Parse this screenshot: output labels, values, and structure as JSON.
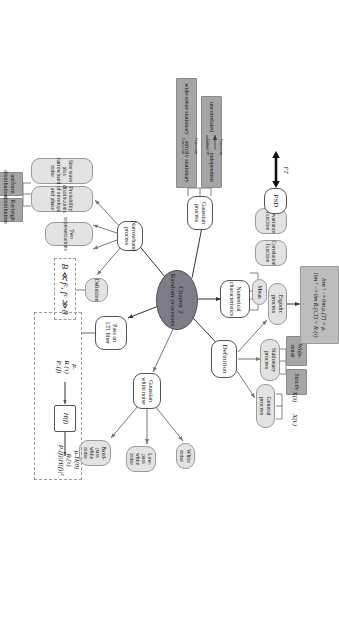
{
  "diagram": {
    "title": "Chapter 2 Random processes",
    "center": {
      "line1": "Chapter 2",
      "line2": "Random processes"
    },
    "colors": {
      "center_fill": "#7d7d8a",
      "dark_node": "#a6a6a6",
      "grey_node": "#e3e3e3",
      "white_node": "#ffffff",
      "formula_fill": "#bdbdbd",
      "stroke": "#555555"
    },
    "branches": {
      "definition": {
        "label": "Definition",
        "children": [
          {
            "label": "Stationary process"
          },
          {
            "label": "General process"
          },
          {
            "label": "Ergodic process"
          }
        ]
      },
      "stationary_kinds": [
        {
          "label": "Wide-sense"
        },
        {
          "label": "Strictly"
        }
      ],
      "general_process_vars": [
        {
          "label": "X(t)"
        },
        {
          "label": "X(tᵢ)"
        }
      ],
      "numerical": {
        "label": "Numerical characteristics",
        "children": [
          {
            "label": "Mean"
          },
          {
            "label": "Correlation function"
          },
          {
            "label": "Covariance function"
          }
        ]
      },
      "psd": {
        "label": "PSD",
        "transform_label": "FT"
      },
      "ergodic_formula": {
        "line1": "lim μₓ(T) = μₓ",
        "line1_limit": "T→∞",
        "line2": "lim Rₓ(τ,T) = Rₓ(τ)",
        "line2_limit": "T→∞"
      },
      "gaussian": {
        "label": "Gaussian process",
        "relations": [
          {
            "left": "wide-sense stationary",
            "right": "strictly stationary",
            "forward_label": "Gaussian",
            "back_label": "Gaussian"
          },
          {
            "left": "uncorrelated",
            "right": "independent",
            "forward_label": "Gaussian",
            "back_label": "Gaussian"
          }
        ]
      },
      "gaussian_white_noise": {
        "label": "Gaussian white noise",
        "children": [
          {
            "label": "White noise"
          },
          {
            "label": "Low-pass white noise"
          },
          {
            "label": "Band-pass white noise"
          }
        ]
      },
      "lti": {
        "label": "Pass an LTI filter",
        "input": {
          "l1": "μₓ",
          "l2": "Rₓ(τ)",
          "l3": "Pₓ(f)"
        },
        "block": "H(f)",
        "output": {
          "l1": "μₓH(0)",
          "l2": "Rᵧ(τ)",
          "l3": "Pₓ(f)|H(f)|²"
        }
      },
      "narrowband": {
        "label": "Narrowband process",
        "children": [
          {
            "label": "Sine wave plus narrowband noise"
          },
          {
            "label": "Probability distributions of envelope and phase"
          },
          {
            "label": "Two representations"
          },
          {
            "label": "Definition"
          }
        ],
        "definition_condition": "B ≪ fᶜ, fᶜ ≫ 0",
        "distributions": [
          {
            "label": "uniform distribution"
          },
          {
            "label": "Rayleigh distribution"
          }
        ]
      }
    }
  }
}
